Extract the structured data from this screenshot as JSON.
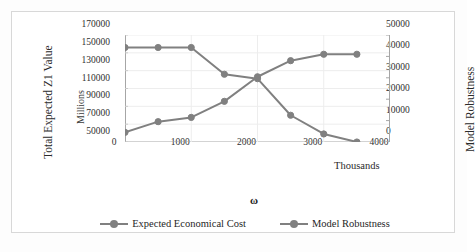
{
  "figure": {
    "left_axis_title": "Total Expected Z1 Value",
    "left_axis_unit_label": "Millions",
    "right_axis_title": "Model Robustness",
    "x_axis_title": "ω",
    "x_axis_unit_label": "Thousands"
  },
  "legend": {
    "items": [
      {
        "label": "Expected Economical Cost",
        "color": "#808080"
      },
      {
        "label": "Model Robustness",
        "color": "#808080"
      }
    ]
  },
  "axes": {
    "y_left_ticks": [
      "170000",
      "150000",
      "130000",
      "110000",
      "90000",
      "70000",
      "50000"
    ],
    "y_right_ticks": [
      "50000",
      "40000",
      "30000",
      "20000",
      "10000",
      "0"
    ],
    "x_ticks": [
      "0",
      "1000",
      "2000",
      "3000",
      "4000"
    ]
  },
  "chart_data": {
    "type": "line",
    "title": "",
    "xlabel": "ω",
    "ylabel": "Total Expected Z1 Value",
    "y2label": "Model Robustness",
    "xlim": [
      0,
      4000
    ],
    "ylim": [
      50000,
      170000
    ],
    "y2lim": [
      0,
      50000
    ],
    "ytick_step": 20000,
    "y2tick_step": 10000,
    "xtick_step": 1000,
    "grid": true,
    "grid_axis": "both",
    "legend_position": "bottom",
    "x_unit": "Thousands",
    "y_unit": "Millions",
    "x": [
      0,
      500,
      1000,
      1500,
      2000,
      2500,
      3000,
      3500
    ],
    "series": [
      {
        "name": "Expected Economical Cost",
        "axis": "left",
        "color": "#808080",
        "marker": "circle",
        "values": [
          156000,
          156000,
          156000,
          126000,
          121000,
          80000,
          59000,
          50000
        ]
      },
      {
        "name": "Model Robustness",
        "axis": "right",
        "color": "#808080",
        "marker": "circle",
        "values": [
          4500,
          9500,
          11500,
          19000,
          30500,
          38000,
          41000,
          41000
        ]
      }
    ]
  }
}
